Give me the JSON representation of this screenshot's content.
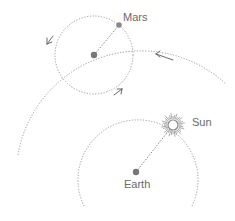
{
  "diagram": {
    "labels": {
      "mars": "Mars",
      "sun": "Sun",
      "earth": "Earth"
    },
    "bodies": [
      {
        "name": "Earth",
        "role": "center of deferent and Sun orbit"
      },
      {
        "name": "Sun",
        "role": "orbits Earth"
      },
      {
        "name": "Mars",
        "role": "rides on epicycle"
      },
      {
        "name": "epicycle center",
        "role": "moves along deferent"
      }
    ],
    "colors": {
      "line": "#9a9a9a",
      "dot": "#777777",
      "text": "#6a6a6a",
      "background": "#ffffff"
    },
    "motion": {
      "deferent_direction": "counterclockwise",
      "epicycle_direction": "counterclockwise"
    }
  }
}
